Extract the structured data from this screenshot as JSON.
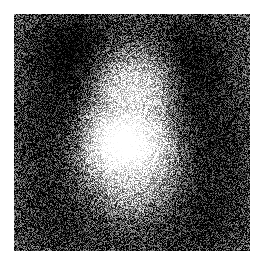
{
  "canvas": {
    "width": 263,
    "height": 268,
    "background_color": "#ffffff"
  },
  "image": {
    "title": "Noisy grayscale portrait reconstruction",
    "alt_text": "Heavily speckled black-and-white image of a human face",
    "content_type": "noisy-grayscale-portrait",
    "region": {
      "x": 14,
      "y": 14,
      "width": 236,
      "height": 237
    },
    "palette": {
      "min_gray": "#000000",
      "max_gray": "#ffffff",
      "mean_gray": "#9a9a9a"
    },
    "noise": {
      "model": "additive-uniform-speckle",
      "amplitude": 118,
      "seed": 20240917,
      "grain_px": 1
    },
    "luminance_field": {
      "base_level": 96,
      "description": "Smooth portrait luminance map rendered beneath the speckle noise",
      "blobs": [
        {
          "name": "face-highlight-core",
          "cx": 0.46,
          "cy": 0.56,
          "rx": 0.14,
          "ry": 0.13,
          "amp": 150,
          "falloff": 2.0
        },
        {
          "name": "face-oval",
          "cx": 0.5,
          "cy": 0.45,
          "rx": 0.26,
          "ry": 0.33,
          "amp": 118,
          "falloff": 2.2
        },
        {
          "name": "forehead-glow",
          "cx": 0.52,
          "cy": 0.27,
          "rx": 0.2,
          "ry": 0.16,
          "amp": 72,
          "falloff": 2.0
        },
        {
          "name": "left-cheek-light",
          "cx": 0.34,
          "cy": 0.52,
          "rx": 0.12,
          "ry": 0.16,
          "amp": 58,
          "falloff": 2.0
        },
        {
          "name": "right-cheek-light",
          "cx": 0.63,
          "cy": 0.58,
          "rx": 0.12,
          "ry": 0.15,
          "amp": 50,
          "falloff": 2.0
        },
        {
          "name": "chin-neck-light",
          "cx": 0.47,
          "cy": 0.76,
          "rx": 0.17,
          "ry": 0.14,
          "amp": 44,
          "falloff": 2.0
        },
        {
          "name": "hair-left-dark",
          "cx": 0.17,
          "cy": 0.44,
          "rx": 0.2,
          "ry": 0.34,
          "amp": -108,
          "falloff": 2.0
        },
        {
          "name": "hair-right-dark",
          "cx": 0.85,
          "cy": 0.52,
          "rx": 0.19,
          "ry": 0.34,
          "amp": -102,
          "falloff": 2.0
        },
        {
          "name": "hair-top-dark",
          "cx": 0.5,
          "cy": 0.07,
          "rx": 0.4,
          "ry": 0.14,
          "amp": -72,
          "falloff": 2.0
        },
        {
          "name": "hair-crown-arc-left",
          "cx": 0.27,
          "cy": 0.17,
          "rx": 0.17,
          "ry": 0.16,
          "amp": -80,
          "falloff": 2.0
        },
        {
          "name": "hair-crown-arc-right",
          "cx": 0.75,
          "cy": 0.2,
          "rx": 0.17,
          "ry": 0.17,
          "amp": -76,
          "falloff": 2.0
        },
        {
          "name": "right-shadow-band",
          "cx": 0.72,
          "cy": 0.4,
          "rx": 0.11,
          "ry": 0.24,
          "amp": -62,
          "falloff": 2.0
        },
        {
          "name": "left-shadow-band",
          "cx": 0.28,
          "cy": 0.36,
          "rx": 0.09,
          "ry": 0.2,
          "amp": -46,
          "falloff": 2.0
        },
        {
          "name": "bottom-left-dark",
          "cx": 0.2,
          "cy": 0.86,
          "rx": 0.24,
          "ry": 0.2,
          "amp": -62,
          "falloff": 2.0
        },
        {
          "name": "bottom-right-dark",
          "cx": 0.8,
          "cy": 0.88,
          "rx": 0.24,
          "ry": 0.2,
          "amp": -58,
          "falloff": 2.0
        },
        {
          "name": "bottom-center-dark",
          "cx": 0.5,
          "cy": 0.97,
          "rx": 0.3,
          "ry": 0.12,
          "amp": -44,
          "falloff": 2.0
        },
        {
          "name": "eye-socket-left",
          "cx": 0.41,
          "cy": 0.4,
          "rx": 0.06,
          "ry": 0.04,
          "amp": -34,
          "falloff": 2.0
        },
        {
          "name": "eye-socket-right",
          "cx": 0.58,
          "cy": 0.42,
          "rx": 0.06,
          "ry": 0.04,
          "amp": -32,
          "falloff": 2.0
        },
        {
          "name": "mouth-shadow",
          "cx": 0.5,
          "cy": 0.66,
          "rx": 0.07,
          "ry": 0.03,
          "amp": -26,
          "falloff": 2.0
        }
      ]
    }
  }
}
